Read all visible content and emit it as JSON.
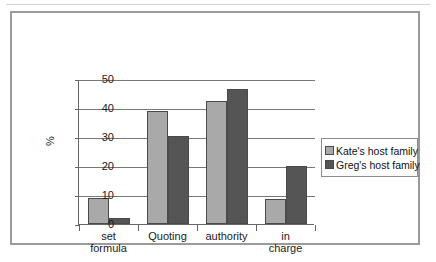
{
  "chart_data": {
    "type": "bar",
    "title": "",
    "xlabel": "",
    "ylabel": "%",
    "ylim": [
      0,
      50
    ],
    "yticks": [
      0,
      10,
      20,
      30,
      40,
      50
    ],
    "grid": true,
    "legend_position": "right",
    "categories": [
      "set\nformula",
      "Quoting",
      "authority",
      "in\ncharge"
    ],
    "series": [
      {
        "name": "Kate's host family",
        "color": "#a9a9a9",
        "values": [
          9,
          39,
          42.5,
          8.5
        ]
      },
      {
        "name": "Greg's host family",
        "color": "#555555",
        "values": [
          2,
          30.5,
          46.5,
          20
        ]
      }
    ]
  }
}
